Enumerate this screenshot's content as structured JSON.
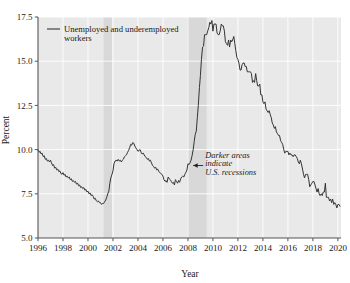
{
  "chart_data": {
    "type": "line",
    "title": "",
    "xlabel": "Year",
    "ylabel": "Percent",
    "xlim": [
      1996.0,
      2020.25
    ],
    "ylim": [
      5.0,
      17.5
    ],
    "grid": true,
    "xticks": [
      1996,
      1998,
      2000,
      2002,
      2004,
      2006,
      2008,
      2010,
      2012,
      2014,
      2016,
      2018,
      2020
    ],
    "xtick_labels": [
      "1996",
      "1998",
      "2000",
      "2002",
      "2004",
      "2006",
      "2008",
      "2010",
      "2012",
      "2014",
      "2016",
      "2018",
      "2020"
    ],
    "yticks": [
      5.0,
      7.5,
      10.0,
      12.5,
      15.0,
      17.5
    ],
    "ytick_labels": [
      "5.0",
      "7.5",
      "10.0",
      "12.5",
      "15.0",
      "17.5"
    ],
    "legend": {
      "position": "top-left-inside",
      "entries": [
        {
          "label": "Unemployed and underemployed workers",
          "color": "#333333"
        }
      ]
    },
    "annotations": [
      {
        "name": "recession-note",
        "text_lines": [
          "Darker areas",
          "indicate",
          "U.S. recessions"
        ],
        "arrow": "left-arrow",
        "x": 2008.9,
        "y": 9.1
      }
    ],
    "shaded_bands": [
      {
        "name": "recession-2001",
        "label": "U.S. recession",
        "x0": 2001.25,
        "x1": 2001.92,
        "color": "#d8d8d8"
      },
      {
        "name": "recession-2008",
        "label": "U.S. recession",
        "x0": 2007.95,
        "x1": 2009.5,
        "color": "#d8d8d8"
      }
    ],
    "plot_background": "#e9e9e9",
    "gridline_color": "#ffffff",
    "series": [
      {
        "name": "Unemployed and underemployed workers",
        "color": "#333333",
        "x": [
          1996.0,
          1996.08,
          1996.17,
          1996.25,
          1996.33,
          1996.42,
          1996.5,
          1996.58,
          1996.67,
          1996.75,
          1996.83,
          1996.92,
          1997.0,
          1997.08,
          1997.17,
          1997.25,
          1997.33,
          1997.42,
          1997.5,
          1997.58,
          1997.67,
          1997.75,
          1997.83,
          1997.92,
          1998.0,
          1998.08,
          1998.17,
          1998.25,
          1998.33,
          1998.42,
          1998.5,
          1998.58,
          1998.67,
          1998.75,
          1998.83,
          1998.92,
          1999.0,
          1999.08,
          1999.17,
          1999.25,
          1999.33,
          1999.42,
          1999.5,
          1999.58,
          1999.67,
          1999.75,
          1999.83,
          1999.92,
          2000.0,
          2000.08,
          2000.17,
          2000.25,
          2000.33,
          2000.42,
          2000.5,
          2000.58,
          2000.67,
          2000.75,
          2000.83,
          2000.92,
          2001.0,
          2001.08,
          2001.17,
          2001.25,
          2001.33,
          2001.42,
          2001.5,
          2001.58,
          2001.67,
          2001.75,
          2001.83,
          2001.92,
          2002.0,
          2002.08,
          2002.17,
          2002.25,
          2002.33,
          2002.42,
          2002.5,
          2002.58,
          2002.67,
          2002.75,
          2002.83,
          2002.92,
          2003.0,
          2003.08,
          2003.17,
          2003.25,
          2003.33,
          2003.42,
          2003.5,
          2003.58,
          2003.67,
          2003.75,
          2003.83,
          2003.92,
          2004.0,
          2004.08,
          2004.17,
          2004.25,
          2004.33,
          2004.42,
          2004.5,
          2004.58,
          2004.67,
          2004.75,
          2004.83,
          2004.92,
          2005.0,
          2005.08,
          2005.17,
          2005.25,
          2005.33,
          2005.42,
          2005.5,
          2005.58,
          2005.67,
          2005.75,
          2005.83,
          2005.92,
          2006.0,
          2006.08,
          2006.17,
          2006.25,
          2006.33,
          2006.42,
          2006.5,
          2006.58,
          2006.67,
          2006.75,
          2006.83,
          2006.92,
          2007.0,
          2007.08,
          2007.17,
          2007.25,
          2007.33,
          2007.42,
          2007.5,
          2007.58,
          2007.67,
          2007.75,
          2007.83,
          2007.92,
          2008.0,
          2008.08,
          2008.17,
          2008.25,
          2008.33,
          2008.42,
          2008.5,
          2008.58,
          2008.67,
          2008.75,
          2008.83,
          2008.92,
          2009.0,
          2009.08,
          2009.17,
          2009.25,
          2009.33,
          2009.42,
          2009.5,
          2009.58,
          2009.67,
          2009.75,
          2009.83,
          2009.92,
          2010.0,
          2010.08,
          2010.17,
          2010.25,
          2010.33,
          2010.42,
          2010.5,
          2010.58,
          2010.67,
          2010.75,
          2010.83,
          2010.92,
          2011.0,
          2011.08,
          2011.17,
          2011.25,
          2011.33,
          2011.42,
          2011.5,
          2011.58,
          2011.67,
          2011.75,
          2011.83,
          2011.92,
          2012.0,
          2012.08,
          2012.17,
          2012.25,
          2012.33,
          2012.42,
          2012.5,
          2012.58,
          2012.67,
          2012.75,
          2012.83,
          2012.92,
          2013.0,
          2013.08,
          2013.17,
          2013.25,
          2013.33,
          2013.42,
          2013.5,
          2013.58,
          2013.67,
          2013.75,
          2013.83,
          2013.92,
          2014.0,
          2014.08,
          2014.17,
          2014.25,
          2014.33,
          2014.42,
          2014.5,
          2014.58,
          2014.67,
          2014.75,
          2014.83,
          2014.92,
          2015.0,
          2015.08,
          2015.17,
          2015.25,
          2015.33,
          2015.42,
          2015.5,
          2015.58,
          2015.67,
          2015.75,
          2015.83,
          2015.92,
          2016.0,
          2016.08,
          2016.17,
          2016.25,
          2016.33,
          2016.42,
          2016.5,
          2016.58,
          2016.67,
          2016.75,
          2016.83,
          2016.92,
          2017.0,
          2017.08,
          2017.17,
          2017.25,
          2017.33,
          2017.42,
          2017.5,
          2017.58,
          2017.67,
          2017.75,
          2017.83,
          2017.92,
          2018.0,
          2018.08,
          2018.17,
          2018.25,
          2018.33,
          2018.42,
          2018.5,
          2018.58,
          2018.67,
          2018.75,
          2018.83,
          2018.92,
          2019.0,
          2019.08,
          2019.17,
          2019.25,
          2019.33,
          2019.42,
          2019.5,
          2019.58,
          2019.67,
          2019.75,
          2019.83,
          2019.92,
          2020.0,
          2020.08,
          2020.17
        ],
        "values": [
          10.0,
          9.85,
          9.9,
          9.75,
          9.8,
          9.6,
          9.65,
          9.45,
          9.5,
          9.35,
          9.4,
          9.3,
          9.4,
          9.25,
          9.1,
          9.15,
          8.95,
          9.0,
          8.85,
          8.9,
          8.75,
          8.8,
          8.65,
          8.6,
          8.7,
          8.55,
          8.6,
          8.45,
          8.5,
          8.4,
          8.45,
          8.3,
          8.35,
          8.2,
          8.25,
          8.15,
          8.2,
          8.05,
          8.1,
          7.95,
          8.0,
          7.85,
          7.9,
          7.8,
          7.85,
          7.7,
          7.75,
          7.6,
          7.65,
          7.5,
          7.55,
          7.4,
          7.45,
          7.35,
          7.2,
          7.25,
          7.1,
          7.05,
          7.1,
          7.0,
          7.0,
          6.9,
          6.95,
          6.95,
          7.05,
          7.15,
          7.3,
          7.5,
          7.65,
          8.1,
          8.4,
          8.6,
          8.8,
          9.2,
          9.35,
          9.4,
          9.35,
          9.45,
          9.35,
          9.4,
          9.3,
          9.4,
          9.45,
          9.6,
          9.65,
          9.7,
          9.85,
          9.95,
          10.1,
          10.3,
          10.25,
          10.4,
          10.35,
          10.2,
          10.1,
          10.0,
          9.9,
          9.95,
          10.0,
          9.85,
          9.75,
          9.8,
          9.7,
          9.6,
          9.55,
          9.45,
          9.5,
          9.35,
          9.4,
          9.25,
          9.1,
          9.05,
          8.95,
          9.0,
          8.85,
          8.9,
          8.75,
          8.7,
          8.65,
          8.6,
          8.5,
          8.3,
          8.2,
          8.25,
          8.15,
          8.45,
          8.35,
          8.3,
          8.2,
          8.1,
          8.15,
          8.0,
          8.3,
          8.2,
          8.1,
          8.25,
          8.15,
          8.35,
          8.45,
          8.5,
          8.45,
          8.6,
          8.7,
          8.85,
          9.2,
          9.15,
          9.25,
          9.4,
          9.65,
          10.0,
          10.45,
          10.85,
          11.05,
          11.8,
          12.5,
          13.5,
          14.2,
          15.1,
          15.8,
          15.85,
          16.5,
          16.5,
          16.5,
          16.7,
          16.9,
          17.2,
          17.1,
          17.3,
          16.7,
          17.1,
          17.1,
          17.1,
          16.6,
          16.5,
          16.5,
          16.7,
          17.1,
          17.0,
          17.0,
          16.7,
          16.1,
          16.0,
          15.9,
          16.2,
          15.8,
          16.2,
          16.1,
          16.2,
          16.4,
          16.0,
          15.6,
          15.2,
          15.1,
          14.9,
          14.5,
          14.5,
          14.8,
          14.9,
          14.9,
          14.7,
          14.7,
          14.4,
          14.4,
          14.4,
          14.4,
          14.3,
          13.8,
          13.9,
          13.8,
          14.3,
          13.9,
          13.6,
          13.6,
          13.7,
          13.1,
          13.1,
          12.7,
          12.6,
          12.7,
          12.3,
          12.2,
          12.1,
          12.2,
          12.0,
          11.8,
          11.5,
          11.4,
          11.2,
          11.3,
          11.0,
          10.9,
          10.8,
          10.8,
          10.5,
          10.4,
          10.3,
          10.0,
          9.8,
          9.9,
          9.9,
          9.9,
          9.7,
          9.8,
          9.7,
          9.7,
          9.6,
          9.7,
          9.7,
          9.6,
          9.5,
          9.3,
          9.2,
          9.4,
          9.2,
          8.9,
          8.6,
          8.4,
          8.6,
          8.6,
          8.6,
          8.3,
          7.9,
          8.0,
          8.1,
          8.2,
          8.2,
          8.0,
          7.8,
          7.6,
          7.8,
          7.5,
          7.4,
          7.5,
          7.4,
          7.6,
          7.6,
          8.1,
          7.3,
          7.3,
          7.3,
          7.1,
          7.2,
          7.0,
          7.2,
          6.9,
          7.0,
          6.9,
          6.7,
          6.9,
          6.9,
          6.8
        ]
      }
    ]
  },
  "axis": {
    "ylabel": "Percent",
    "xlabel": "Year"
  }
}
